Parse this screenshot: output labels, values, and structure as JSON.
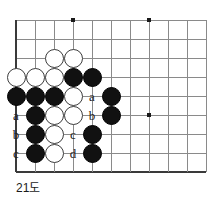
{
  "figure": {
    "caption": "21도",
    "kind": "go-board-diagram"
  },
  "board": {
    "origin_x": 16,
    "origin_y": 20,
    "spacing": 19,
    "cols": 11,
    "rows": 9,
    "line_color": "#8a8a8a",
    "edge_color": "#3a3a3a",
    "background": "#ffffff",
    "left_edge_is_board_edge": true,
    "bottom_edge_is_board_edge": true,
    "star_points": [
      {
        "col": 3,
        "row": 0
      },
      {
        "col": 7,
        "row": 0
      },
      {
        "col": 7,
        "row": 5
      }
    ]
  },
  "stones": {
    "black_color": "#111111",
    "white_color": "#ffffff",
    "list": [
      {
        "col": 0,
        "row": 3,
        "color": "white"
      },
      {
        "col": 1,
        "row": 3,
        "color": "white"
      },
      {
        "col": 2,
        "row": 3,
        "color": "white"
      },
      {
        "col": 3,
        "row": 3,
        "color": "black"
      },
      {
        "col": 4,
        "row": 3,
        "color": "black"
      },
      {
        "col": 2,
        "row": 2,
        "color": "white"
      },
      {
        "col": 3,
        "row": 2,
        "color": "white"
      },
      {
        "col": 0,
        "row": 4,
        "color": "black"
      },
      {
        "col": 1,
        "row": 4,
        "color": "black"
      },
      {
        "col": 2,
        "row": 4,
        "color": "black"
      },
      {
        "col": 3,
        "row": 4,
        "color": "white"
      },
      {
        "col": 5,
        "row": 4,
        "color": "black"
      },
      {
        "col": 1,
        "row": 5,
        "color": "black"
      },
      {
        "col": 2,
        "row": 5,
        "color": "white"
      },
      {
        "col": 3,
        "row": 5,
        "color": "white"
      },
      {
        "col": 5,
        "row": 5,
        "color": "black"
      },
      {
        "col": 1,
        "row": 6,
        "color": "black"
      },
      {
        "col": 2,
        "row": 6,
        "color": "white"
      },
      {
        "col": 4,
        "row": 6,
        "color": "black"
      },
      {
        "col": 1,
        "row": 7,
        "color": "black"
      },
      {
        "col": 2,
        "row": 7,
        "color": "white"
      },
      {
        "col": 4,
        "row": 7,
        "color": "black"
      }
    ]
  },
  "labels": [
    {
      "col": 0,
      "row": 5,
      "text": "a"
    },
    {
      "col": 0,
      "row": 6,
      "text": "b"
    },
    {
      "col": 0,
      "row": 7,
      "text": "c"
    },
    {
      "col": 4,
      "row": 4,
      "text": "a"
    },
    {
      "col": 4,
      "row": 5,
      "text": "b"
    },
    {
      "col": 3,
      "row": 6,
      "text": "c"
    },
    {
      "col": 3,
      "row": 7,
      "text": "d"
    }
  ]
}
